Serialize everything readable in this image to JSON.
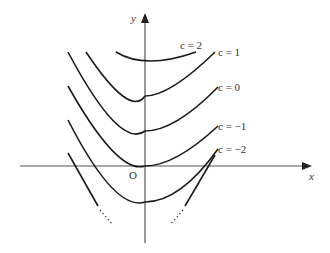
{
  "figure": {
    "axes": {
      "x_label": "x",
      "y_label": "y",
      "origin_label": "O"
    },
    "curves": [
      {
        "c_label": "c = 2",
        "c": 2
      },
      {
        "c_label": "c = 1",
        "c": 1
      },
      {
        "c_label": "c = 0",
        "c": 0
      },
      {
        "c_label": "c = −1",
        "c": -1
      },
      {
        "c_label": "c = −2",
        "c": -2
      }
    ],
    "colors": {
      "curve": "#1a1a1a",
      "axis": "#555555",
      "text": "#333333"
    }
  }
}
